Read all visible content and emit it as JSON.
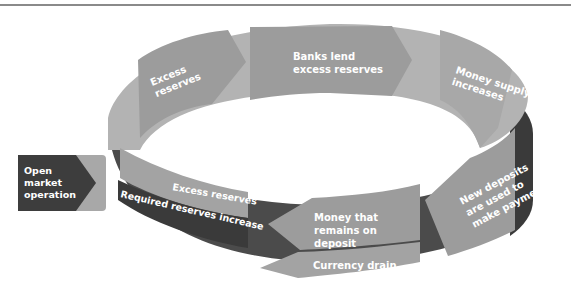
{
  "diagram": {
    "start": {
      "label_lines": [
        "Open",
        "market",
        "operation"
      ]
    },
    "top_band": [
      {
        "id": "excess-reserves-top",
        "label_lines": [
          "Excess",
          "reserves"
        ]
      },
      {
        "id": "banks-lend",
        "label_lines": [
          "Banks lend",
          "excess reserves"
        ]
      },
      {
        "id": "money-supply",
        "label_lines": [
          "Money supply",
          "increases"
        ]
      }
    ],
    "right_side": {
      "id": "new-deposits",
      "label_lines": [
        "New deposits",
        "are used to",
        "make payments"
      ]
    },
    "bottom_band": [
      {
        "id": "money-remains",
        "label_lines": [
          "Money that",
          "remains on",
          "deposit"
        ]
      },
      {
        "id": "currency-drain",
        "label_lines": [
          "Currency drain"
        ]
      },
      {
        "id": "excess-reserves-bottom",
        "label_lines": [
          "Excess reserves"
        ]
      },
      {
        "id": "required-reserves",
        "label_lines": [
          "Required reserves increase"
        ]
      }
    ],
    "colors": {
      "band_light": "#b3b3b3",
      "arrow_mid": "#9c9c9c",
      "band_dark": "#4b4b4b",
      "band_darker": "#3a3a3a",
      "text": "#ffffff",
      "rule": "#8a8a8a"
    }
  }
}
